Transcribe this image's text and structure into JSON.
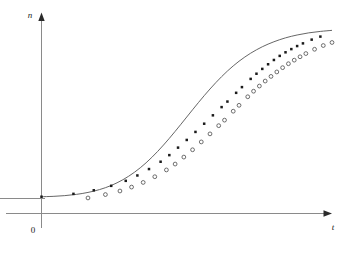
{
  "chart_data": {
    "type": "line",
    "title": "",
    "subtitle": "",
    "xlabel": "t",
    "ylabel": "n",
    "origin_label": "0",
    "grid": false,
    "legend": null,
    "axis_style": "arrowed-axes",
    "annotations": [],
    "xlim": [
      0,
      100
    ],
    "ylim": [
      0,
      100
    ],
    "series": [
      {
        "name": "fitted-curve",
        "marker": "none",
        "x": [
          0,
          4,
          8,
          12,
          16,
          20,
          24,
          28,
          32,
          36,
          40,
          44,
          48,
          52,
          56,
          60,
          64,
          68,
          72,
          76,
          80,
          84,
          88,
          92,
          96,
          100
        ],
        "values": [
          1.0,
          1.2,
          1.6,
          2.3,
          3.4,
          5.0,
          7.3,
          10.5,
          14.7,
          20.0,
          26.4,
          33.7,
          41.6,
          49.7,
          57.6,
          64.9,
          71.4,
          76.9,
          81.4,
          85.0,
          87.8,
          90.0,
          91.6,
          92.8,
          93.6,
          94.2
        ]
      },
      {
        "name": "upper-markers",
        "marker": "filled-square",
        "x": [
          0,
          11,
          18,
          24,
          29,
          33,
          37,
          41,
          44,
          47,
          50,
          53,
          56,
          59,
          62,
          64,
          67,
          69,
          72,
          74,
          76,
          78,
          80,
          82,
          84,
          86,
          88,
          90,
          93,
          96
        ],
        "values": [
          1.0,
          2.6,
          4.6,
          7.1,
          9.9,
          12.9,
          16.5,
          20.6,
          24.3,
          28.5,
          32.8,
          37.3,
          41.9,
          46.6,
          51.2,
          54.3,
          59.2,
          62.4,
          67.0,
          69.9,
          72.6,
          75.2,
          77.6,
          79.9,
          81.9,
          83.7,
          85.4,
          86.9,
          89.0,
          90.7
        ]
      },
      {
        "name": "lower-markers",
        "marker": "hollow-circle",
        "x": [
          16,
          22,
          27,
          31,
          35,
          39,
          43,
          46,
          49,
          52,
          55,
          58,
          61,
          63,
          66,
          68,
          71,
          73,
          75,
          77,
          79,
          81,
          83,
          85,
          87,
          89,
          91,
          94,
          97,
          100
        ],
        "values": [
          0.3,
          2.2,
          4.2,
          6.4,
          9.0,
          12.2,
          16.0,
          19.3,
          23.2,
          27.3,
          31.7,
          36.2,
          40.8,
          43.9,
          48.9,
          52.2,
          57.0,
          60.1,
          63.0,
          65.8,
          68.4,
          70.9,
          73.3,
          75.5,
          77.5,
          79.4,
          81.2,
          83.6,
          85.7,
          87.4
        ]
      }
    ],
    "colors": {
      "axis": "#6b6b6b",
      "curve": "#555555",
      "filled_marker": "#1a1a1a",
      "hollow_marker_stroke": "#4a4a4a",
      "hollow_marker_fill": "#ffffff",
      "background": "#ffffff"
    }
  }
}
